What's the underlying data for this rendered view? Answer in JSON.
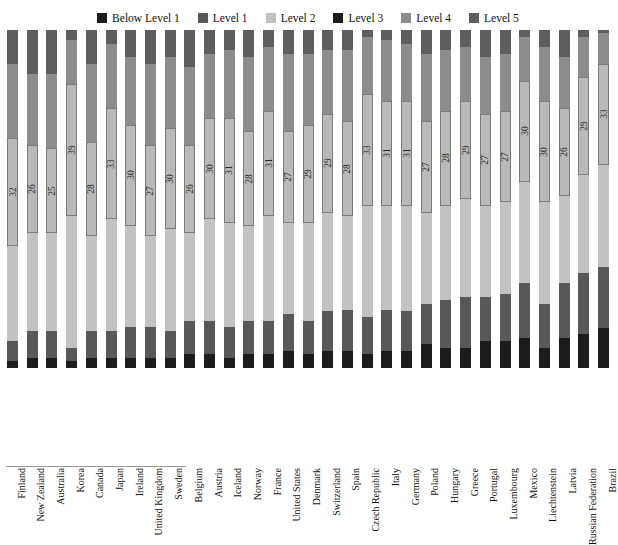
{
  "chart_data": {
    "type": "bar",
    "subtype": "stacked-column-100",
    "title": "",
    "subtitle": "",
    "xlabel": "",
    "ylabel": "",
    "ylim": [
      0,
      100
    ],
    "grid": false,
    "legend_position": "top-center",
    "stack_order_bottom_to_top": [
      "Below Level 1",
      "Level 1",
      "Level 2",
      "Level 3",
      "Level 4",
      "Level 5"
    ],
    "legend": [
      {
        "label": "Below Level 1",
        "color": "#1c1c1c"
      },
      {
        "label": "Level 1",
        "color": "#585858"
      },
      {
        "label": "Level 2",
        "color": "#c2c2c2"
      },
      {
        "label": "Level 3",
        "color": "#1c1c1c"
      },
      {
        "label": "Level 4",
        "color": "#8c8c8c"
      },
      {
        "label": "Level 5",
        "color": "#5e5e5e"
      }
    ],
    "categories": [
      "Finland",
      "New Zealand",
      "Australia",
      "Korea",
      "Canada",
      "Japan",
      "Ireland",
      "United Kingdom",
      "Sweden",
      "Belgium",
      "Austria",
      "Iceland",
      "Norway",
      "France",
      "United States",
      "Denmark",
      "Switzerland",
      "Spain",
      "Czech Republic",
      "Italy",
      "Germany",
      "Poland",
      "Hungary",
      "Greece",
      "Portugal",
      "Luxembourg",
      "Mexico",
      "Liechtenstein",
      "Latvia",
      "Russian Federation",
      "Brazil"
    ],
    "series": [
      {
        "name": "Below Level 1",
        "color": "#1c1c1c",
        "values": [
          2,
          3,
          3,
          2,
          3,
          3,
          3,
          3,
          3,
          4,
          4,
          3,
          4,
          4,
          5,
          4,
          5,
          5,
          4,
          5,
          5,
          7,
          6,
          6,
          8,
          8,
          9,
          6,
          9,
          10,
          13
        ]
      },
      {
        "name": "Level 1",
        "color": "#585858",
        "values": [
          6,
          8,
          8,
          4,
          8,
          8,
          9,
          9,
          8,
          10,
          10,
          9,
          10,
          10,
          11,
          10,
          12,
          12,
          11,
          12,
          12,
          12,
          14,
          15,
          13,
          14,
          16,
          13,
          16,
          18,
          20
        ]
      },
      {
        "name": "Level 2",
        "color": "#c2c2c2",
        "values": [
          28,
          29,
          29,
          39,
          28,
          33,
          30,
          27,
          30,
          26,
          30,
          31,
          28,
          31,
          27,
          29,
          29,
          28,
          33,
          31,
          31,
          27,
          28,
          29,
          27,
          27,
          30,
          30,
          26,
          29,
          33
        ]
      },
      {
        "name": "Level 3",
        "color": "#b9b9b9",
        "values": [
          32,
          26,
          25,
          39,
          28,
          33,
          30,
          27,
          30,
          26,
          30,
          31,
          28,
          31,
          27,
          29,
          29,
          28,
          33,
          31,
          31,
          27,
          28,
          29,
          27,
          27,
          30,
          30,
          26,
          29,
          33
        ]
      },
      {
        "name": "Level 4",
        "color": "#8c8c8c",
        "values": [
          22,
          21,
          22,
          13,
          23,
          19,
          20,
          24,
          21,
          23,
          19,
          20,
          22,
          19,
          23,
          21,
          19,
          21,
          17,
          18,
          17,
          20,
          18,
          16,
          17,
          17,
          13,
          16,
          15,
          12,
          10
        ]
      },
      {
        "name": "Level 5",
        "color": "#5e5e5e",
        "values": [
          10,
          13,
          13,
          3,
          10,
          4,
          8,
          10,
          8,
          11,
          7,
          6,
          8,
          5,
          7,
          7,
          6,
          6,
          2,
          3,
          4,
          7,
          6,
          5,
          8,
          7,
          2,
          5,
          8,
          2,
          1
        ]
      }
    ],
    "data_labels": {
      "note": "Level 3 percentage printed inside each column",
      "values": [
        32,
        26,
        25,
        39,
        28,
        33,
        30,
        27,
        30,
        26,
        30,
        31,
        28,
        31,
        27,
        29,
        29,
        28,
        33,
        31,
        31,
        27,
        28,
        29,
        27,
        27,
        30,
        30,
        26,
        29,
        33
      ]
    }
  }
}
